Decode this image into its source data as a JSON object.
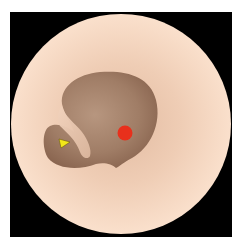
{
  "diagram": {
    "type": "otoscopic-view",
    "background_color": "#000000",
    "field_of_view": {
      "color_center": "#e8c4ab",
      "color_edge": "#f8dcc6"
    },
    "cavity": {
      "color_dark": "#8e6a55",
      "color_light": "#b08f78"
    },
    "markers": [
      {
        "name": "red-dot",
        "color": "#e8301c",
        "shape": "circle"
      },
      {
        "name": "yellow-arrowhead",
        "color": "#f2e81a",
        "shape": "triangle",
        "direction": "right"
      }
    ]
  }
}
